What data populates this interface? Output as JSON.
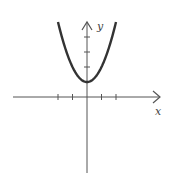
{
  "chart_data": {
    "type": "line",
    "title": "",
    "xlabel": "x",
    "ylabel": "y",
    "function": "y = x^2 + 1",
    "vertex": [
      0,
      1
    ],
    "x_ticks": [
      -2,
      -1,
      1,
      2
    ],
    "y_ticks": [
      2,
      3,
      4
    ],
    "xlim": [
      -5,
      5
    ],
    "ylim": [
      -5,
      5
    ],
    "grid": false,
    "legend": "none",
    "series": [
      {
        "name": "parabola",
        "x": [
          -2,
          -1.5,
          -1,
          -0.5,
          0,
          0.5,
          1,
          1.5,
          2
        ],
        "y": [
          5,
          3.25,
          2,
          1.25,
          1,
          1.25,
          2,
          3.25,
          5
        ]
      }
    ]
  },
  "labels": {
    "x_axis": "x",
    "y_axis": "y"
  },
  "colors": {
    "axis": "#555555",
    "curve": "#333333",
    "background": "#ffffff"
  }
}
